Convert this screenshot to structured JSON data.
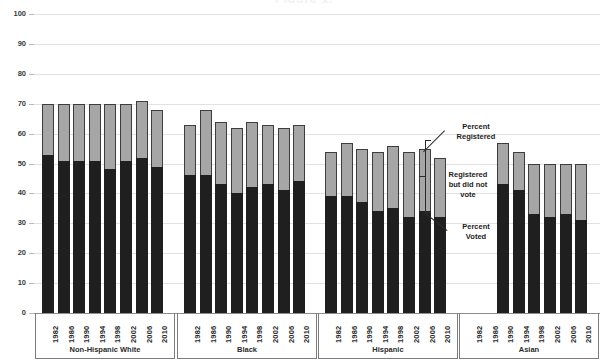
{
  "chart_data": {
    "type": "bar",
    "title": "Figure 1.",
    "subtitle": "",
    "xlabel": "",
    "ylabel": "",
    "ylim": [
      0,
      100
    ],
    "yticks": [
      0,
      10,
      20,
      30,
      40,
      50,
      60,
      70,
      80,
      90,
      100
    ],
    "grid": true,
    "stacked": true,
    "legend_position": "annotations-inline",
    "annotations": [
      {
        "id": "percent-registered",
        "text": "Percent Registered",
        "points_to": "top of full bar"
      },
      {
        "id": "registered-not-voted",
        "text": "Registered but did not vote",
        "points_to": "grey segment"
      },
      {
        "id": "percent-voted",
        "text": "Percent Voted",
        "points_to": "black segment"
      }
    ],
    "series": [
      {
        "name": "Percent Voted",
        "color": "#1f1f1f"
      },
      {
        "name": "Registered but did not vote",
        "color": "#a6a6a6"
      }
    ],
    "categories": [
      "1982",
      "1986",
      "1990",
      "1994",
      "1998",
      "2002",
      "2006",
      "2010"
    ],
    "groups": [
      {
        "label": "Non-Hispanic White",
        "years": [
          "1982",
          "1986",
          "1990",
          "1994",
          "1998",
          "2002",
          "2006",
          "2010"
        ],
        "registered": [
          70,
          70,
          70,
          70,
          70,
          70,
          71,
          68
        ],
        "voted": [
          53,
          51,
          51,
          51,
          48,
          51,
          52,
          49
        ]
      },
      {
        "label": "Black",
        "years": [
          "1982",
          "1986",
          "1990",
          "1994",
          "1998",
          "2002",
          "2006",
          "2010"
        ],
        "registered": [
          63,
          68,
          64,
          62,
          64,
          63,
          62,
          63
        ],
        "voted": [
          46,
          46,
          43,
          40,
          42,
          43,
          41,
          44
        ]
      },
      {
        "label": "Hispanic",
        "years": [
          "1982",
          "1986",
          "1990",
          "1994",
          "1998",
          "2002",
          "2006",
          "2010"
        ],
        "registered": [
          54,
          57,
          55,
          54,
          56,
          54,
          55,
          52
        ],
        "voted": [
          39,
          39,
          37,
          34,
          35,
          32,
          34,
          32
        ]
      },
      {
        "label": "Asian",
        "years": [
          "1982",
          "1986",
          "1990",
          "1994",
          "1998",
          "2002",
          "2006",
          "2010"
        ],
        "registered": [
          null,
          null,
          57,
          54,
          50,
          50,
          50,
          50
        ],
        "voted": [
          null,
          null,
          43,
          41,
          33,
          32,
          33,
          31
        ]
      }
    ]
  }
}
